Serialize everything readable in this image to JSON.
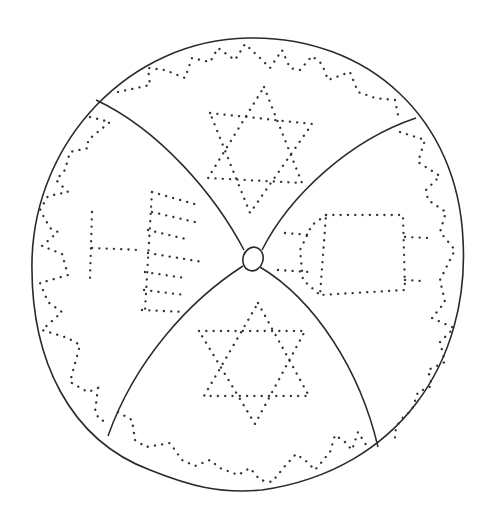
{
  "illustration": {
    "subject": "Kippah (yarmulke) coloring-page line drawing, top view",
    "colors": {
      "line": "#2a2a2a",
      "dots": "#333333",
      "background": "#ffffff"
    },
    "panels": [
      {
        "position": "top",
        "motif": "star-of-david"
      },
      {
        "position": "left",
        "motif": "menorah"
      },
      {
        "position": "right",
        "motif": "torah-scroll"
      },
      {
        "position": "bottom",
        "motif": "star-of-david"
      }
    ],
    "border_pattern": "dotted zigzag along rim",
    "center": "button"
  }
}
